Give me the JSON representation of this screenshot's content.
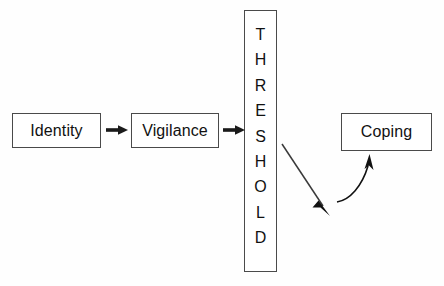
{
  "diagram": {
    "background_color": "#fefefe",
    "stroke_color": "#4a4a4a",
    "arrow_color": "#1a1a1a",
    "text_color": "#111111",
    "nodes": [
      {
        "id": "identity",
        "label": "Identity",
        "shape": "rectangle",
        "orientation": "horizontal"
      },
      {
        "id": "vigilance",
        "label": "Vigilance",
        "shape": "rectangle",
        "orientation": "horizontal"
      },
      {
        "id": "threshold",
        "label": "THRESHOLD",
        "shape": "rectangle",
        "orientation": "vertical"
      },
      {
        "id": "coping",
        "label": "Coping",
        "shape": "rectangle",
        "orientation": "horizontal"
      }
    ],
    "threshold_letters": [
      "T",
      "H",
      "R",
      "E",
      "S",
      "H",
      "O",
      "L",
      "D"
    ],
    "connectors": [
      {
        "id": "identity-to-vigilance",
        "from": "identity",
        "to": "vigilance",
        "style": "straight-block-arrow"
      },
      {
        "id": "vigilance-to-threshold",
        "from": "vigilance",
        "to": "threshold",
        "style": "straight-block-arrow"
      },
      {
        "id": "threshold-down-arrow",
        "from": "threshold",
        "to": "",
        "style": "diagonal-thin-arrow"
      },
      {
        "id": "curve-to-coping",
        "from": "",
        "to": "coping",
        "style": "curved-thin-arrow"
      }
    ]
  }
}
